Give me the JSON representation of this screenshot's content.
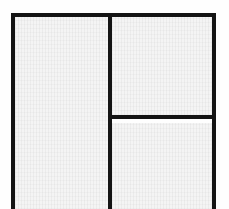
{
  "image": {
    "title": "Partitioned rectangular frame diagram",
    "description": "Scanned line drawing of a rectangle divided into three panels: one tall panel on the left and a right column split horizontally into an upper and a lower panel. The drawing is cropped at the bottom edge of the image.",
    "width_px": 229,
    "height_px": 209
  },
  "colors": {
    "ink": "#141414",
    "panel_fill": "#f4f4f4",
    "page_background": "#ffffff"
  },
  "frame": {
    "label": "outer-frame",
    "left_px": 11,
    "top_px": 13,
    "right_px": 216,
    "stroke_width_px": 4,
    "bottom_cropped": true
  },
  "dividers": [
    {
      "name": "vertical-divider",
      "orientation": "vertical",
      "position_px": 110,
      "stroke_width_px": 4,
      "spans": "full height of frame"
    },
    {
      "name": "horizontal-divider",
      "orientation": "horizontal",
      "position_px": 117,
      "stroke_width_px": 4,
      "spans": "vertical divider to right border"
    }
  ],
  "panels": [
    {
      "name": "left-panel",
      "label": "",
      "approx_bounds_px": [
        15,
        17,
        108,
        209
      ],
      "fill": "#f4f4f4"
    },
    {
      "name": "right-upper-panel",
      "label": "",
      "approx_bounds_px": [
        112,
        17,
        212,
        115
      ],
      "fill": "#f4f4f4"
    },
    {
      "name": "right-lower-panel",
      "label": "",
      "approx_bounds_px": [
        112,
        119,
        212,
        209
      ],
      "fill": "#f4f4f4"
    }
  ]
}
